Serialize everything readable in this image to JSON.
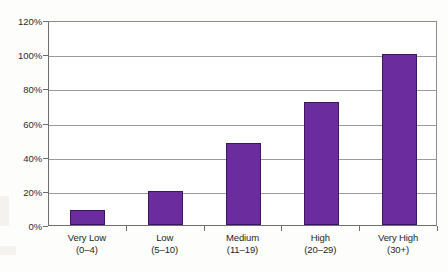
{
  "chart_data": {
    "type": "bar",
    "title": "",
    "xlabel": "",
    "ylabel": "",
    "categories": [
      "Very Low",
      "Low",
      "Medium",
      "High",
      "Very High"
    ],
    "category_sublabels": [
      "(0–4)",
      "(5–10)",
      "(11–19)",
      "(20–29)",
      "(30+)"
    ],
    "values": [
      9,
      20,
      48,
      72,
      100
    ],
    "value_labels": [
      "9%",
      "20%",
      "48%",
      "72%",
      "100%"
    ],
    "ylim": [
      0,
      120
    ],
    "ytick_values": [
      0,
      20,
      40,
      60,
      80,
      100,
      120
    ],
    "ytick_labels": [
      "0%",
      "20%",
      "40%",
      "60%",
      "80%",
      "100%",
      "120%"
    ],
    "grid": true,
    "legend": false,
    "legend_position": "none",
    "bar_color": "#6b2c9e",
    "bar_border_color": "#3d1560",
    "axis_color": "#6e6e6e",
    "gridline_color": "#9a9a9a",
    "plot_background": "#ffffff",
    "page_background": "#fdfdfb"
  }
}
